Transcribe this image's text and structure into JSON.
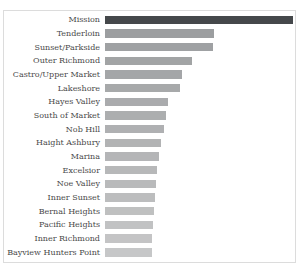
{
  "chart_data": {
    "type": "bar",
    "orientation": "horizontal",
    "title": "Police Department Incidents by Neighborhood",
    "title_clipped": true,
    "xlabel": "",
    "ylabel": "",
    "axis_tick_labels_visible": false,
    "grid": false,
    "legend": false,
    "sort": "descending",
    "panel_border_color": "#dcdcdc",
    "label_color": "#4a4a4a",
    "highlight_category": "Mission",
    "highlight_color": "#45484b",
    "categories": [
      "Mission",
      "Tenderloin",
      "Sunset/Parkside",
      "Outer Richmond",
      "Castro/Upper Market",
      "Lakeshore",
      "Hayes Valley",
      "South of Market",
      "Nob Hill",
      "Haight Ashbury",
      "Marina",
      "Excelsior",
      "Noe Valley",
      "Inner Sunset",
      "Bernal Heights",
      "Pacific Heights",
      "Inner Richmond",
      "Bayview Hunters Point"
    ],
    "values": [
      188,
      109,
      108,
      87,
      77,
      75,
      63,
      61,
      59,
      56,
      54,
      52,
      51,
      50,
      49,
      48,
      47,
      47
    ],
    "value_units": "bar length in screenshot pixels (no numeric axis visible)",
    "bar_colors": [
      "#45484b",
      "#9c9ea0",
      "#9fa1a3",
      "#a2a4a5",
      "#a4a6a8",
      "#a7a9aa",
      "#aaabad",
      "#acaeaf",
      "#afb0b2",
      "#b2b3b4",
      "#b4b5b7",
      "#b7b8b9",
      "#b9babb",
      "#bcbdbe",
      "#bfc0c0",
      "#c1c2c3",
      "#c4c4c5",
      "#c6c7c8"
    ]
  }
}
